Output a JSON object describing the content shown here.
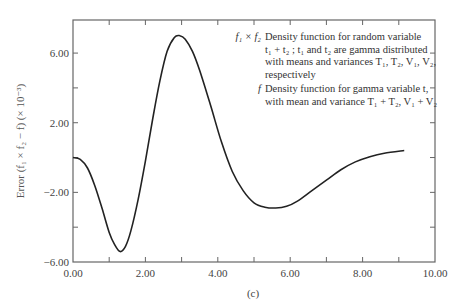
{
  "chart_data": {
    "type": "line",
    "title": "",
    "caption": "(c)",
    "xlabel": "",
    "ylabel": "Error (f₁ × f₂ − f) (× 10⁻³)",
    "xlim": [
      0,
      10
    ],
    "ylim": [
      -6,
      7.9
    ],
    "grid": false,
    "x_ticks": [
      0,
      2,
      4,
      6,
      8,
      10
    ],
    "x_tick_labels": [
      "0.00",
      "2.00",
      "4.00",
      "6.00",
      "8.00",
      "10.00"
    ],
    "x_minor_ticks": [
      1,
      3,
      5,
      7,
      9
    ],
    "y_ticks": [
      -6,
      -2,
      2,
      6
    ],
    "y_tick_labels": [
      "−6.00",
      "−2.00",
      "2.00",
      "6.00"
    ],
    "y_minor_ticks": [
      -4,
      0,
      4
    ],
    "series": [
      {
        "name": "f1 x f2 - f",
        "color": "#222222",
        "x": [
          0.0,
          0.2,
          0.4,
          0.6,
          0.8,
          1.0,
          1.15,
          1.3,
          1.45,
          1.6,
          1.8,
          2.0,
          2.2,
          2.4,
          2.6,
          2.8,
          2.95,
          3.1,
          3.3,
          3.5,
          3.8,
          4.1,
          4.4,
          4.7,
          5.0,
          5.3,
          5.6,
          5.9,
          6.2,
          6.6,
          7.0,
          7.4,
          7.8,
          8.2,
          8.6,
          9.15
        ],
        "values": [
          0.0,
          -0.1,
          -0.6,
          -1.6,
          -2.9,
          -4.3,
          -5.0,
          -5.4,
          -5.1,
          -4.2,
          -2.4,
          -0.2,
          2.2,
          4.4,
          6.1,
          6.9,
          7.0,
          6.8,
          6.1,
          5.0,
          3.0,
          0.9,
          -0.8,
          -1.9,
          -2.6,
          -2.85,
          -2.9,
          -2.8,
          -2.5,
          -1.9,
          -1.3,
          -0.7,
          -0.25,
          0.05,
          0.25,
          0.4
        ]
      }
    ],
    "legend": {
      "position": "upper-right-inside",
      "entries": [
        {
          "symbol": "f₁ × f₂",
          "lines": [
            "Density function for random variable",
            "t₁ + t₂ ; t₁ and t₂ are gamma distributed",
            "with means and variances T₁, T₂, V₁, V₂,",
            "respectively"
          ]
        },
        {
          "symbol": "f",
          "lines": [
            "Density function for gamma variable t,",
            "with mean and variance T₁ + T₂, V₁ + V₂"
          ]
        }
      ]
    }
  },
  "colors": {
    "axis": "#666666",
    "curve": "#222222",
    "text": "#333333"
  }
}
